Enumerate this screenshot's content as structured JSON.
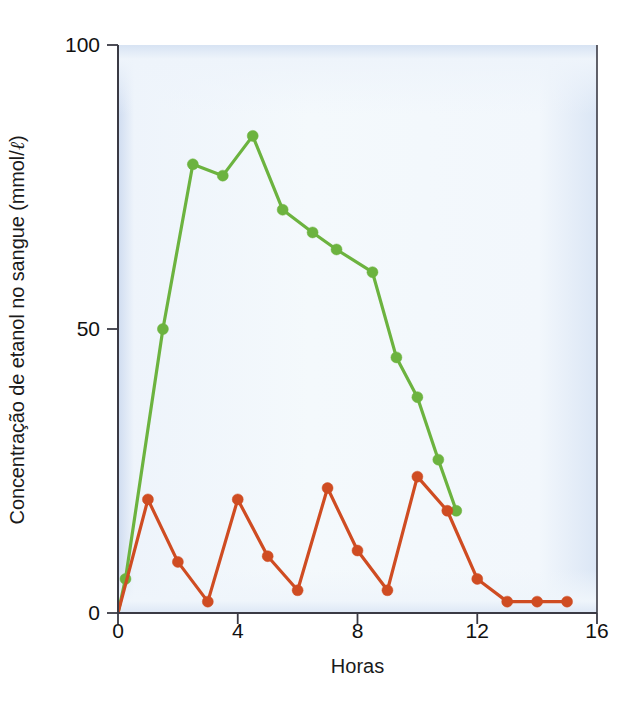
{
  "chart_data": {
    "type": "line",
    "title": "",
    "xlabel": "Horas",
    "ylabel": "Concentração de etanol no sangue (mmol/ℓ)",
    "ylabel_parts": {
      "before": "Concentração de etanol no sangue (mmol/",
      "italic_unit": "ℓ",
      "after": ")"
    },
    "xlim": [
      0,
      16
    ],
    "ylim": [
      0,
      100
    ],
    "xticks": [
      0,
      4,
      8,
      12,
      16
    ],
    "xtick_labels": [
      "0",
      "4",
      "8",
      "12",
      "16"
    ],
    "yticks": [
      0,
      50,
      100
    ],
    "ytick_labels": [
      "0",
      "50",
      "100"
    ],
    "grid": false,
    "legend": null,
    "plot_background": "#f3f8fc",
    "plot_border_tint": "#d5e2f2",
    "axis_color": "#3a3a44",
    "series": [
      {
        "name": "green-series",
        "color": "#6cb33f",
        "marker": "circle",
        "marker_size": 11,
        "line_width": 3.2,
        "points": [
          {
            "x": 0.0,
            "y": 0
          },
          {
            "x": 0.25,
            "y": 6
          },
          {
            "x": 1.5,
            "y": 50
          },
          {
            "x": 2.5,
            "y": 79
          },
          {
            "x": 3.5,
            "y": 77
          },
          {
            "x": 4.5,
            "y": 84
          },
          {
            "x": 5.5,
            "y": 71
          },
          {
            "x": 6.5,
            "y": 67
          },
          {
            "x": 7.3,
            "y": 64
          },
          {
            "x": 8.5,
            "y": 60
          },
          {
            "x": 9.3,
            "y": 45
          },
          {
            "x": 10.0,
            "y": 38
          },
          {
            "x": 10.7,
            "y": 27
          },
          {
            "x": 11.3,
            "y": 18
          }
        ]
      },
      {
        "name": "red-series",
        "color": "#cf4c22",
        "marker": "circle",
        "marker_size": 11,
        "line_width": 3.2,
        "points": [
          {
            "x": 0,
            "y": 0
          },
          {
            "x": 1,
            "y": 20
          },
          {
            "x": 2,
            "y": 9
          },
          {
            "x": 3,
            "y": 2
          },
          {
            "x": 4,
            "y": 20
          },
          {
            "x": 5,
            "y": 10
          },
          {
            "x": 6,
            "y": 4
          },
          {
            "x": 7,
            "y": 22
          },
          {
            "x": 8,
            "y": 11
          },
          {
            "x": 9,
            "y": 4
          },
          {
            "x": 10,
            "y": 24
          },
          {
            "x": 11,
            "y": 18
          },
          {
            "x": 12,
            "y": 6
          },
          {
            "x": 13,
            "y": 2
          },
          {
            "x": 14,
            "y": 2
          },
          {
            "x": 15,
            "y": 2
          }
        ]
      }
    ]
  }
}
